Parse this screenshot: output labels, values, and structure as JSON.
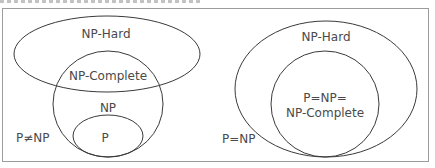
{
  "diagram": {
    "type": "euler-diagram",
    "left": {
      "condition_label": "P≠NP",
      "sets": [
        {
          "name": "np-hard",
          "label": "NP-Hard"
        },
        {
          "name": "np-complete",
          "label": "NP-Complete"
        },
        {
          "name": "np",
          "label": "NP"
        },
        {
          "name": "p",
          "label": "P"
        }
      ]
    },
    "right": {
      "condition_label": "P=NP",
      "sets": [
        {
          "name": "np-hard",
          "label": "NP-Hard"
        },
        {
          "name": "p-np-complete",
          "label_line1": "P=NP=",
          "label_line2": "NP-Complete"
        }
      ]
    },
    "colors": {
      "stroke": "#3a3a3a",
      "text": "#4a4a4a",
      "frame": "#9c9c9c"
    }
  }
}
